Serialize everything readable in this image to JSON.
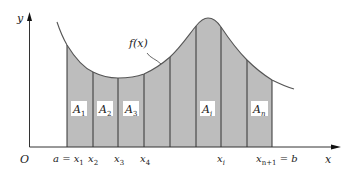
{
  "diagram": {
    "colors": {
      "fill": "#bdbdbd",
      "stroke": "#333333",
      "curve": "#555555",
      "label_bg": "#ffffff"
    },
    "axes": {
      "x_label": "x",
      "y_label": "y",
      "origin_label": "O"
    },
    "curve_label": "f(x)",
    "partition_labels": [
      {
        "main": "a = x",
        "sub": "1"
      },
      {
        "main": "x",
        "sub": "2"
      },
      {
        "main": "x",
        "sub": "3"
      },
      {
        "main": "x",
        "sub": "4"
      },
      {
        "main": "x",
        "sub": "i"
      },
      {
        "main": "x",
        "sub": "n+1",
        "suffix": " = b"
      }
    ],
    "strip_labels": [
      {
        "main": "A",
        "sub": "1"
      },
      {
        "main": "A",
        "sub": "2"
      },
      {
        "main": "A",
        "sub": "3"
      },
      {
        "main": "A",
        "sub": "i"
      },
      {
        "main": "A",
        "sub": "n"
      }
    ],
    "strip_count": 8
  }
}
